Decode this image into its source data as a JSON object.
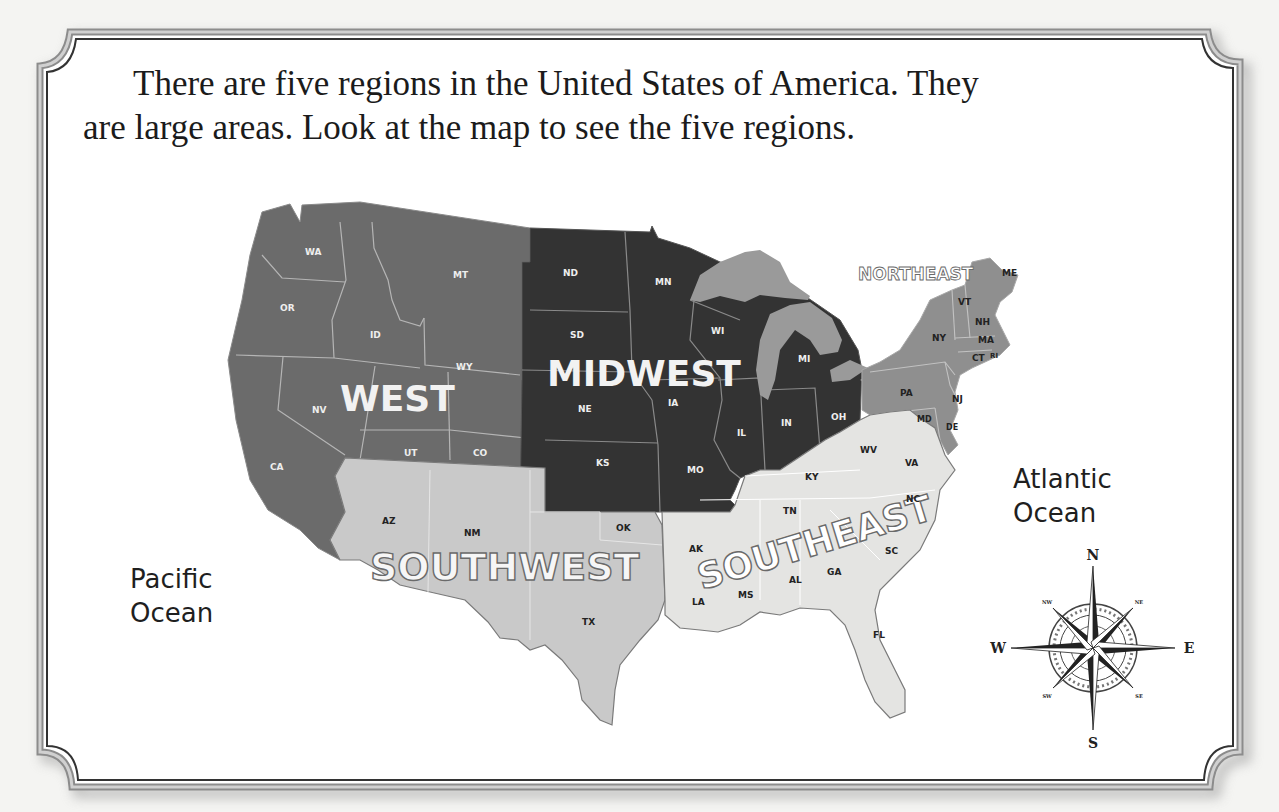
{
  "intro": {
    "line1": "There are five regions in the United States of America.  They",
    "line2": "are large areas.  Look at the map to see the five regions."
  },
  "oceans": {
    "pacific_line1": "Pacific",
    "pacific_line2": "Ocean",
    "atlantic_line1": "Atlantic",
    "atlantic_line2": "Ocean"
  },
  "regions": {
    "west": {
      "label": "WEST",
      "color": "#6a6a6a",
      "states": [
        "WA",
        "OR",
        "CA",
        "NV",
        "ID",
        "MT",
        "WY",
        "UT",
        "CO"
      ]
    },
    "midwest": {
      "label": "MIDWEST",
      "color": "#333333",
      "states": [
        "ND",
        "SD",
        "NE",
        "KS",
        "MN",
        "IA",
        "MO",
        "WI",
        "IL",
        "MI",
        "IN",
        "OH"
      ]
    },
    "northeast": {
      "label": "NORTHEAST",
      "color": "#8f8f8f",
      "states": [
        "ME",
        "VT",
        "NH",
        "NY",
        "MA",
        "CT",
        "RI",
        "PA",
        "NJ",
        "MD",
        "DE"
      ]
    },
    "southwest": {
      "label": "SOUTHWEST",
      "color": "#c7c7c7",
      "states": [
        "AZ",
        "NM",
        "OK",
        "TX"
      ]
    },
    "southeast": {
      "label": "SOUTHEAST",
      "color": "#e4e4e2",
      "states": [
        "WV",
        "VA",
        "KY",
        "TN",
        "NC",
        "SC",
        "AK",
        "LA",
        "MS",
        "AL",
        "GA",
        "FL"
      ]
    }
  },
  "state_labels": {
    "WA": "WA",
    "OR": "OR",
    "CA": "CA",
    "NV": "NV",
    "ID": "ID",
    "MT": "MT",
    "WY": "WY",
    "UT": "UT",
    "CO": "CO",
    "ND": "ND",
    "SD": "SD",
    "NE": "NE",
    "KS": "KS",
    "MN": "MN",
    "IA": "IA",
    "MO": "MO",
    "WI": "WI",
    "IL": "IL",
    "MI": "MI",
    "IN": "IN",
    "OH": "OH",
    "ME": "ME",
    "VT": "VT",
    "NH": "NH",
    "NY": "NY",
    "MA": "MA",
    "CT": "CT",
    "RI": "RI",
    "PA": "PA",
    "NJ": "NJ",
    "MD": "MD",
    "DE": "DE",
    "AZ": "AZ",
    "NM": "NM",
    "OK": "OK",
    "TX": "TX",
    "WV": "WV",
    "VA": "VA",
    "KY": "KY",
    "TN": "TN",
    "NC": "NC",
    "SC": "SC",
    "AK": "AK",
    "LA": "LA",
    "MS": "MS",
    "AL": "AL",
    "GA": "GA",
    "FL": "FL"
  },
  "compass": {
    "n": "N",
    "s": "S",
    "e": "E",
    "w": "W",
    "nw": "NW",
    "ne": "NE",
    "sw": "SW",
    "se": "SE"
  },
  "colors": {
    "lakes": "#9a9a9a",
    "border": "#555555",
    "background": "#f4f4f2"
  }
}
